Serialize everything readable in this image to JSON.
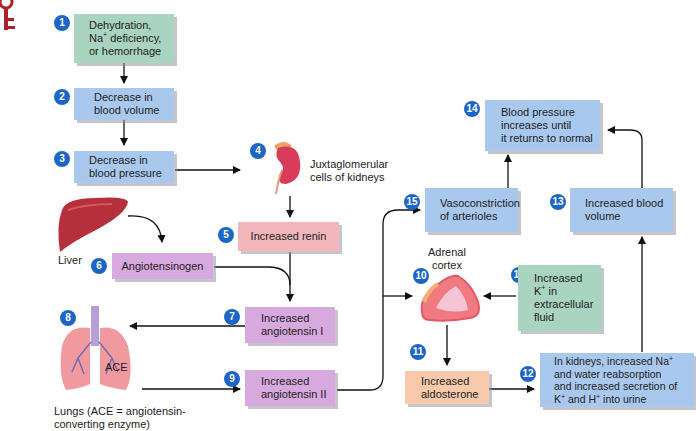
{
  "corner_icon": "key-icon",
  "steps": {
    "s1": {
      "num": "1",
      "text_a": "Dehydration,",
      "text_b_pre": "Na",
      "text_b_sup": "+",
      "text_b_post": " deficiency,",
      "text_c": "or hemorrhage"
    },
    "s2": {
      "num": "2",
      "text_a": "Decrease in",
      "text_b": "blood volume"
    },
    "s3": {
      "num": "3",
      "text_a": "Decrease in",
      "text_b": "blood pressure"
    },
    "s4": {
      "num": "4",
      "text_a": "Juxtaglomerular",
      "text_b": "cells of kidneys",
      "icon": "kidney-icon"
    },
    "s5": {
      "num": "5",
      "text": "Increased renin"
    },
    "s6": {
      "num": "6",
      "text": "Angiotensinogen"
    },
    "s7": {
      "num": "7",
      "text_a": "Increased",
      "text_b": "angiotensin I"
    },
    "s8": {
      "num": "8",
      "icon": "lungs-icon",
      "ace": "ACE",
      "caption_a": "Lungs (ACE = angiotensin-",
      "caption_b": "converting enzyme)"
    },
    "s9": {
      "num": "9",
      "text_a": "Increased",
      "text_b": "angiotensin II"
    },
    "s10": {
      "num": "10",
      "label_a": "Adrenal",
      "label_b": "cortex",
      "icon": "adrenal-gland-icon"
    },
    "s11": {
      "num": "11",
      "text_a": "Increased",
      "text_b": "aldosterone"
    },
    "s12": {
      "num": "12",
      "line1_pre": "In kidneys, increased Na",
      "line1_sup": "+",
      "line2": "and water reabsorption",
      "line3": "and increased secretion of",
      "line4_k": "K",
      "line4_sup1": "+",
      "line4_mid": " and H",
      "line4_sup2": "+",
      "line4_post": " into urine"
    },
    "s13": {
      "num": "13",
      "text_a": "Increased blood",
      "text_b": "volume"
    },
    "s14": {
      "num": "14",
      "text_a": "Blood pressure",
      "text_b": "increases until",
      "text_c": "it returns to normal"
    },
    "s15": {
      "num": "15",
      "text_a": "Vasoconstriction",
      "text_b": "of arterioles"
    },
    "s16": {
      "num": "16",
      "text_a": "Increased",
      "text_b_pre": "K",
      "text_b_sup": "+",
      "text_b_post": " in",
      "text_c": "extracellular",
      "text_d": "fluid"
    }
  },
  "liver": {
    "label": "Liver",
    "icon": "liver-icon"
  },
  "colors": {
    "number_badge": "#1d66c8",
    "green_box": "#a9d4c0",
    "blue_box": "#a8c8ee",
    "pink_box": "#f4b6bd",
    "purple_box": "#d8a9de",
    "orange_box": "#f8c9aa"
  }
}
